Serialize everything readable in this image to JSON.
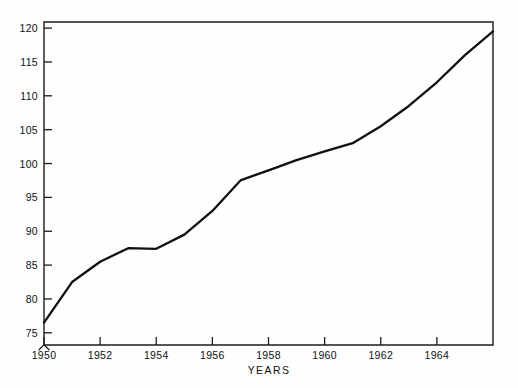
{
  "chart_data": {
    "type": "line",
    "title": "",
    "subtitle": "",
    "xlabel": "YEARS",
    "ylabel": "",
    "x": [
      1950,
      1951,
      1952,
      1953,
      1954,
      1955,
      1956,
      1957,
      1958,
      1959,
      1960,
      1961,
      1962,
      1963,
      1964,
      1965,
      1966
    ],
    "values": [
      76.5,
      82.5,
      85.5,
      87.5,
      87.4,
      89.5,
      93.0,
      97.5,
      99.0,
      100.5,
      101.8,
      103.0,
      105.5,
      108.5,
      112.0,
      116.0,
      119.5
    ],
    "series": [
      {
        "name": "index",
        "values": [
          76.5,
          82.5,
          85.5,
          87.5,
          87.4,
          89.5,
          93.0,
          97.5,
          99.0,
          100.5,
          101.8,
          103.0,
          105.5,
          108.5,
          112.0,
          116.0,
          119.5
        ]
      }
    ],
    "xlim": [
      1950,
      1966
    ],
    "ylim": [
      73.2,
      120.9
    ],
    "grid": false,
    "legend": false,
    "legend_position": "none",
    "y_axis_break": true,
    "line_color": "#101010",
    "axis_color": "#1c1c1c",
    "background_color": "#fefefe",
    "y_ticks": [
      {
        "value": 75,
        "label": "75"
      },
      {
        "value": 80,
        "label": "80"
      },
      {
        "value": 85,
        "label": "85"
      },
      {
        "value": 90,
        "label": "90"
      },
      {
        "value": 95,
        "label": "95"
      },
      {
        "value": 100,
        "label": "100"
      },
      {
        "value": 105,
        "label": "105"
      },
      {
        "value": 110,
        "label": "110"
      },
      {
        "value": 115,
        "label": "115"
      },
      {
        "value": 120,
        "label": "120"
      }
    ],
    "x_ticks": [
      {
        "value": 1950,
        "label": "1950"
      },
      {
        "value": 1952,
        "label": "1952"
      },
      {
        "value": 1954,
        "label": "1954"
      },
      {
        "value": 1956,
        "label": "1956"
      },
      {
        "value": 1958,
        "label": "1958"
      },
      {
        "value": 1960,
        "label": "1960"
      },
      {
        "value": 1962,
        "label": "1962"
      },
      {
        "value": 1964,
        "label": "1964"
      }
    ]
  }
}
